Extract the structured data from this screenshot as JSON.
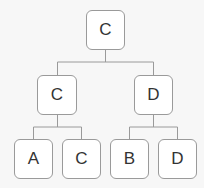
{
  "tree": {
    "root": {
      "label": "C"
    },
    "level2": [
      {
        "label": "C"
      },
      {
        "label": "D"
      }
    ],
    "leaves": [
      {
        "label": "A"
      },
      {
        "label": "C"
      },
      {
        "label": "B"
      },
      {
        "label": "D"
      }
    ]
  },
  "colors": {
    "background": "#f7f7f7",
    "node_fill": "#ffffff",
    "node_border": "#9a9a9a",
    "line": "#9a9a9a",
    "text": "#333333"
  }
}
